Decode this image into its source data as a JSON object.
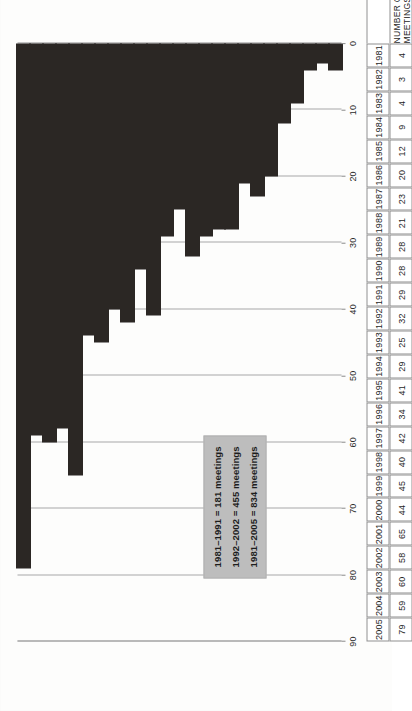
{
  "chart_data": {
    "type": "bar",
    "orientation": "horizontal",
    "title": "",
    "xlabel": "NUMBER OF MEETINGS",
    "ylabel": "",
    "xlim": [
      0,
      90
    ],
    "xticks": [
      0,
      10,
      20,
      30,
      40,
      50,
      60,
      70,
      80,
      90
    ],
    "grid": true,
    "categories": [
      "1981",
      "1982",
      "1983",
      "1984",
      "1985",
      "1986",
      "1987",
      "1988",
      "1989",
      "1990",
      "1991",
      "1992",
      "1993",
      "1994",
      "1995",
      "1996",
      "1997",
      "1998",
      "1999",
      "2000",
      "2001",
      "2002",
      "2003",
      "2004",
      "2005"
    ],
    "values": [
      4,
      3,
      4,
      9,
      12,
      20,
      23,
      21,
      28,
      28,
      29,
      32,
      25,
      29,
      41,
      34,
      42,
      40,
      45,
      44,
      65,
      58,
      60,
      59,
      79
    ],
    "bar_color": "#2b2724",
    "annotations": [
      "1981–1991 = 181 meetings",
      "1992–2002 = 455 meetings",
      "1981–2005 = 834 meetings"
    ],
    "legend_position": "inside-upper-left"
  },
  "axis": {
    "value_axis_label": "NUMBER OF MEETINGS",
    "tick_labels": [
      "0",
      "10",
      "20",
      "30",
      "40",
      "50",
      "60",
      "70",
      "80",
      "90"
    ]
  },
  "table": {
    "header_label": "NUMBER OF MEETINGS",
    "rows": [
      {
        "year": "1981",
        "value": "4"
      },
      {
        "year": "1982",
        "value": "3"
      },
      {
        "year": "1983",
        "value": "4"
      },
      {
        "year": "1984",
        "value": "9"
      },
      {
        "year": "1985",
        "value": "12"
      },
      {
        "year": "1986",
        "value": "20"
      },
      {
        "year": "1987",
        "value": "23"
      },
      {
        "year": "1988",
        "value": "21"
      },
      {
        "year": "1989",
        "value": "28"
      },
      {
        "year": "1990",
        "value": "28"
      },
      {
        "year": "1991",
        "value": "29"
      },
      {
        "year": "1992",
        "value": "32"
      },
      {
        "year": "1993",
        "value": "25"
      },
      {
        "year": "1994",
        "value": "29"
      },
      {
        "year": "1995",
        "value": "41"
      },
      {
        "year": "1996",
        "value": "34"
      },
      {
        "year": "1997",
        "value": "42"
      },
      {
        "year": "1998",
        "value": "40"
      },
      {
        "year": "1999",
        "value": "45"
      },
      {
        "year": "2000",
        "value": "44"
      },
      {
        "year": "2001",
        "value": "65"
      },
      {
        "year": "2002",
        "value": "58"
      },
      {
        "year": "2003",
        "value": "60"
      },
      {
        "year": "2004",
        "value": "59"
      },
      {
        "year": "2005",
        "value": "79"
      }
    ]
  },
  "legend": {
    "lines": [
      "1981–1991 = 181 meetings",
      "1992–2002 = 455 meetings",
      "1981–2005 = 834 meetings"
    ],
    "background": "#bdbdbd"
  },
  "colors": {
    "bar": "#2b2724",
    "gridline": "#a8a8a8",
    "axis": "#8a8a8a",
    "legend_bg": "#bdbdbd",
    "page_bg": "#fdfdfc"
  }
}
